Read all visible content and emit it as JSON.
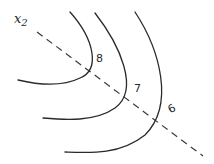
{
  "diagram": {
    "axis": {
      "label": "x",
      "subscript": "2"
    },
    "contours": [
      {
        "level": "8"
      },
      {
        "level": "7"
      },
      {
        "level": "6"
      }
    ],
    "colors": {
      "stroke": "#2a2a2a",
      "background": "#ffffff"
    }
  }
}
